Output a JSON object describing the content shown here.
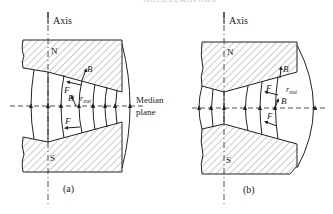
{
  "header": {
    "text": "ACCELERATORS"
  },
  "panels": [
    {
      "id": "a",
      "caption": "(a)",
      "axis_label": "Axis",
      "north_label": "N",
      "south_label": "S",
      "median_label_line1": "Median",
      "median_label_line2": "plane",
      "vector_labels": {
        "B_top": "B",
        "F_top": "F",
        "B_mid": "B",
        "F_bottom": "F",
        "r_out": "r",
        "r_out_sub": "out"
      }
    },
    {
      "id": "b",
      "caption": "(b)",
      "axis_label": "Axis",
      "north_label": "N",
      "south_label": "S",
      "vector_labels": {
        "B_top": "B",
        "F_top": "F",
        "B_mid": "B",
        "F_bottom": "F",
        "r_out": "r",
        "r_out_sub": "out"
      }
    }
  ],
  "colors": {
    "line": "#222222",
    "hatch": "#555555",
    "background": "#ffffff"
  }
}
